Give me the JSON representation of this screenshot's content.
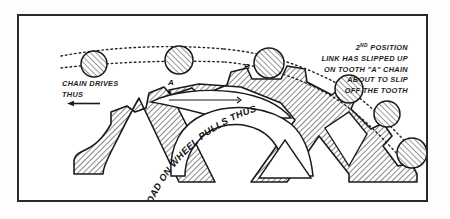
{
  "figure": {
    "type": "technical-line-drawing",
    "border_color": "#2a2a2a",
    "background_color": "#ffffff",
    "hatch_color": "#6e6e6e",
    "outline_color": "#1a1a1a",
    "roller_fill": "#9a9a9a"
  },
  "annotations": {
    "left_caption": {
      "lines": [
        "CHAIN DRIVES",
        "THUS"
      ],
      "arrow": "left-arrow"
    },
    "right_caption": {
      "lines": [
        "2ND POSITION",
        "LINK HAS SLIPPED UP",
        "ON TOOTH \"A\" CHAIN",
        "ABOUT TO SLIP",
        "OFF THE TOOTH"
      ],
      "ordinal_number": "2",
      "ordinal_suffix": "ND",
      "line2": "LINK HAS SLIPPED UP",
      "line3": "ON TOOTH \"A\" CHAIN",
      "line4": "ABOUT TO SLIP",
      "line5": "OFF THE TOOTH"
    },
    "arc_label": "LOAD ON WHEEL PULLS THUS",
    "tooth_a_label": "A",
    "tooth_b_label": "B"
  },
  "chain": {
    "roller_count": 7,
    "rollers": [
      {
        "cx": 75,
        "cy": 48,
        "r": 13
      },
      {
        "cx": 160,
        "cy": 44,
        "r": 14
      },
      {
        "cx": 250,
        "cy": 47,
        "r": 15
      },
      {
        "cx": 330,
        "cy": 73,
        "r": 14
      },
      {
        "cx": 368,
        "cy": 98,
        "r": 13
      },
      {
        "cx": 393,
        "cy": 137,
        "r": 15
      }
    ]
  }
}
